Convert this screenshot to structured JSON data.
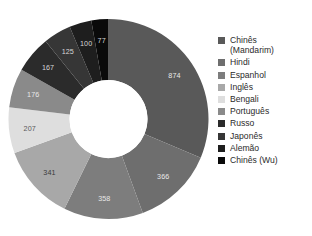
{
  "chart_data": {
    "type": "pie",
    "variant": "donut",
    "title": "",
    "subtitle": "",
    "xlabel": "",
    "ylabel": "",
    "legend_position": "right",
    "grid": false,
    "start_angle_deg": 0,
    "direction": "clockwise",
    "inner_radius_ratio": 0.39,
    "total": 2791,
    "categories": [
      "Chinês (Mandarim)",
      "Hindi",
      "Espanhol",
      "Inglês",
      "Bengali",
      "Português",
      "Russo",
      "Japonês",
      "Alemão",
      "Chinês (Wu)"
    ],
    "values": [
      874,
      366,
      358,
      341,
      207,
      176,
      167,
      125,
      100,
      77
    ],
    "data_labels": [
      "874",
      "366",
      "358",
      "341",
      "207",
      "176",
      "167",
      "125",
      "100",
      "77"
    ],
    "colors": [
      "#595959",
      "#6e6e6e",
      "#7d7d7d",
      "#a8a8a8",
      "#dedede",
      "#8a8a8a",
      "#2b2b2b",
      "#363636",
      "#1e1e1e",
      "#0a0a0a"
    ],
    "label_colors": [
      "#e8e8e8",
      "#e8e8e8",
      "#e8e8e8",
      "#3a3a3a",
      "#5a5a5a",
      "#e8e8e8",
      "#d6d6d6",
      "#d6d6d6",
      "#d6d6d6",
      "#d6d6d6"
    ],
    "background": "#ffffff",
    "hole_color": "#ffffff"
  },
  "legend": {
    "items": [
      {
        "label": "Chinês\n(Mandarim)",
        "color": "#595959",
        "swatch_name": "legend-swatch-chines-mandarim"
      },
      {
        "label": "Hindi",
        "color": "#6e6e6e",
        "swatch_name": "legend-swatch-hindi"
      },
      {
        "label": "Espanhol",
        "color": "#7d7d7d",
        "swatch_name": "legend-swatch-espanhol"
      },
      {
        "label": "Inglês",
        "color": "#a8a8a8",
        "swatch_name": "legend-swatch-ingles"
      },
      {
        "label": "Bengali",
        "color": "#dedede",
        "swatch_name": "legend-swatch-bengali"
      },
      {
        "label": "Português",
        "color": "#8a8a8a",
        "swatch_name": "legend-swatch-portugues"
      },
      {
        "label": "Russo",
        "color": "#2b2b2b",
        "swatch_name": "legend-swatch-russo"
      },
      {
        "label": "Japonês",
        "color": "#363636",
        "swatch_name": "legend-swatch-japones"
      },
      {
        "label": "Alemão",
        "color": "#1e1e1e",
        "swatch_name": "legend-swatch-alemao"
      },
      {
        "label": "Chinês (Wu)",
        "color": "#0a0a0a",
        "swatch_name": "legend-swatch-chines-wu"
      }
    ]
  }
}
